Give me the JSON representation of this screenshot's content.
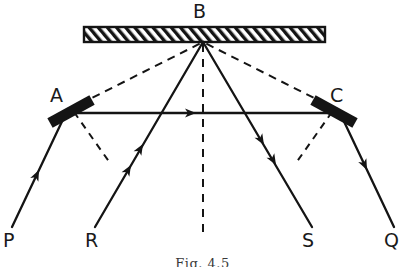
{
  "figure": {
    "kind": "optics-ray-diagram",
    "caption": "Fig. 4.5",
    "stroke_color": "#141414",
    "mirror_fill": "#141414",
    "background": "#ffffff"
  },
  "labels": {
    "b": "B",
    "a": "A",
    "c": "C",
    "p": "P",
    "r": "R",
    "s": "S",
    "q": "Q"
  },
  "components": {
    "mirror_b": {
      "name": "B",
      "type": "plane-mirror-hatched",
      "x1": 84,
      "y1": 27,
      "x2": 325,
      "y2": 42
    },
    "mirror_a": {
      "name": "A",
      "type": "plane-mirror-tilted",
      "x1": 50,
      "y1": 122,
      "x2": 92,
      "y2": 100,
      "thickness": 9
    },
    "mirror_c": {
      "name": "C",
      "type": "plane-mirror-tilted",
      "x1": 313,
      "y1": 100,
      "x2": 355,
      "y2": 122,
      "thickness": 9
    }
  },
  "rays": {
    "solid": [
      {
        "id": "p-to-a",
        "from": "P",
        "to": "A",
        "x1": 12,
        "y1": 227,
        "x2": 66,
        "y2": 113,
        "arrows": 1
      },
      {
        "id": "r-to-b",
        "from": "R",
        "to": "B",
        "x1": 95,
        "y1": 227,
        "x2": 203,
        "y2": 42,
        "arrows": 2
      },
      {
        "id": "b-to-s",
        "from": "B",
        "to": "S",
        "x1": 203,
        "y1": 42,
        "x2": 312,
        "y2": 227,
        "arrows": 2
      },
      {
        "id": "c-to-q",
        "from": "C",
        "to": "Q",
        "x1": 340,
        "y1": 113,
        "x2": 394,
        "y2": 227,
        "arrows": 1
      },
      {
        "id": "a-to-c",
        "from": "A",
        "to": "C",
        "x1": 66,
        "y1": 113,
        "x2": 340,
        "y2": 113,
        "arrows": 1
      }
    ],
    "dashed": [
      {
        "id": "a-to-b-virtual",
        "from": "A",
        "to": "B",
        "x1": 80,
        "y1": 104,
        "x2": 203,
        "y2": 42
      },
      {
        "id": "c-to-b-virtual",
        "from": "C",
        "to": "B",
        "x1": 326,
        "y1": 104,
        "x2": 203,
        "y2": 42
      },
      {
        "id": "normal-at-b",
        "from": "B",
        "to": "below",
        "x1": 203,
        "y1": 44,
        "x2": 203,
        "y2": 235
      },
      {
        "id": "normal-at-a",
        "from": "A",
        "to": "below-right",
        "x1": 74,
        "y1": 112,
        "x2": 110,
        "y2": 163
      },
      {
        "id": "normal-at-c",
        "from": "C",
        "to": "below-left",
        "x1": 332,
        "y1": 112,
        "x2": 296,
        "y2": 163
      }
    ]
  },
  "label_positions": {
    "b": {
      "x": 193,
      "y": 4
    },
    "a": {
      "x": 52,
      "y": 88
    },
    "c": {
      "x": 330,
      "y": 88
    },
    "p": {
      "x": 4,
      "y": 232
    },
    "r": {
      "x": 86,
      "y": 232
    },
    "s": {
      "x": 303,
      "y": 232
    },
    "q": {
      "x": 385,
      "y": 232
    },
    "caption": {
      "y": 254
    }
  }
}
